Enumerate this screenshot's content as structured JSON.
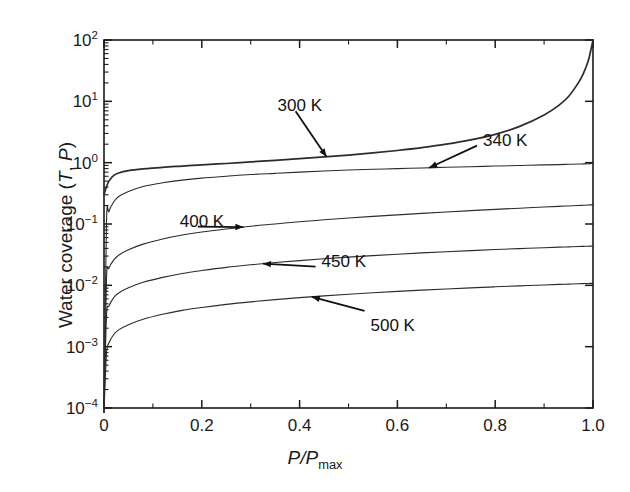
{
  "chart_data": {
    "type": "line",
    "title": "",
    "xlabel": "P/Pmax",
    "ylabel": "Water coverage (T, P)",
    "xlim": [
      0,
      1.0
    ],
    "ylim": [
      0.0001,
      100
    ],
    "yscale": "log",
    "xscale": "linear",
    "grid": false,
    "legend": "inline-annotations",
    "xticks": [
      "0",
      "0.2",
      "0.4",
      "0.6",
      "0.8",
      "1.0"
    ],
    "xtick_values": [
      0,
      0.2,
      0.4,
      0.6,
      0.8,
      1.0
    ],
    "ytick_values": [
      0.0001,
      0.001,
      0.01,
      0.1,
      1,
      10,
      100
    ],
    "yticks": [
      "10-4",
      "10-3",
      "10-2",
      "10-1",
      "100",
      "101",
      "102"
    ],
    "x": [
      0.0,
      0.005,
      0.01,
      0.02,
      0.03,
      0.05,
      0.08,
      0.12,
      0.16,
      0.2,
      0.25,
      0.3,
      0.35,
      0.4,
      0.45,
      0.5,
      0.55,
      0.6,
      0.65,
      0.7,
      0.75,
      0.8,
      0.85,
      0.9,
      0.93,
      0.95,
      0.97,
      0.98,
      0.99,
      0.995,
      1.0
    ],
    "series": [
      {
        "name": "300 K",
        "label": "300 K",
        "values": [
          0.3,
          0.4,
          0.5,
          0.62,
          0.68,
          0.74,
          0.79,
          0.84,
          0.88,
          0.92,
          0.97,
          1.03,
          1.09,
          1.16,
          1.24,
          1.33,
          1.44,
          1.58,
          1.76,
          2.0,
          2.35,
          2.9,
          3.9,
          6.0,
          8.6,
          12.0,
          20.0,
          28.0,
          45.0,
          65.0,
          100.0
        ]
      },
      {
        "name": "340 K",
        "label": "340 K",
        "values": [
          0.0,
          0.1,
          0.16,
          0.23,
          0.28,
          0.34,
          0.41,
          0.47,
          0.52,
          0.56,
          0.6,
          0.64,
          0.67,
          0.7,
          0.73,
          0.76,
          0.78,
          0.8,
          0.82,
          0.84,
          0.86,
          0.88,
          0.9,
          0.92,
          0.93,
          0.94,
          0.95,
          0.955,
          0.96,
          0.965,
          0.97
        ]
      },
      {
        "name": "400 K",
        "label": "400 K",
        "values": [
          0.0,
          0.012,
          0.019,
          0.026,
          0.031,
          0.038,
          0.047,
          0.057,
          0.066,
          0.074,
          0.083,
          0.092,
          0.1,
          0.109,
          0.117,
          0.125,
          0.133,
          0.141,
          0.149,
          0.157,
          0.165,
          0.173,
          0.181,
          0.189,
          0.194,
          0.197,
          0.2,
          0.202,
          0.204,
          0.205,
          0.206
        ]
      },
      {
        "name": "450 K",
        "label": "450 K",
        "values": [
          0.0,
          0.003,
          0.0046,
          0.0063,
          0.0075,
          0.0091,
          0.0112,
          0.0135,
          0.0156,
          0.0174,
          0.0196,
          0.0216,
          0.0235,
          0.0253,
          0.0271,
          0.0288,
          0.0305,
          0.0322,
          0.0338,
          0.0353,
          0.0368,
          0.0383,
          0.0397,
          0.0411,
          0.0419,
          0.0424,
          0.0429,
          0.0432,
          0.0434,
          0.0436,
          0.0437
        ]
      },
      {
        "name": "500 K",
        "label": "500 K",
        "values": [
          0.0,
          0.00075,
          0.00115,
          0.00158,
          0.00188,
          0.00228,
          0.0028,
          0.00338,
          0.0039,
          0.00435,
          0.00489,
          0.00538,
          0.00585,
          0.0063,
          0.00673,
          0.00715,
          0.00756,
          0.00796,
          0.00835,
          0.00873,
          0.0091,
          0.00946,
          0.00981,
          0.01015,
          0.01035,
          0.01048,
          0.01061,
          0.01067,
          0.01073,
          0.01076,
          0.01079
        ]
      }
    ],
    "annotations": [
      {
        "text": "300 K",
        "series": "300 K",
        "x_label": 0.355,
        "y_label": 8.0
      },
      {
        "text": "340 K",
        "series": "340 K",
        "x_label": 0.775,
        "y_label": 2.2
      },
      {
        "text": "400 K",
        "series": "400 K",
        "x_label": 0.155,
        "y_label": 0.105
      },
      {
        "text": "450 K",
        "series": "450 K",
        "x_label": 0.445,
        "y_label": 0.0235
      },
      {
        "text": "500 K",
        "series": "500 K",
        "x_label": 0.545,
        "y_label": 0.0021
      }
    ]
  },
  "axes": {
    "y_title_prefix": "Water coverage (",
    "y_title_T": "T",
    "y_title_mid": ", ",
    "y_title_P": "P",
    "y_title_suffix": ")",
    "x_title_P1": "P",
    "x_title_slash": "/",
    "x_title_P2": "P",
    "x_title_sub": "max"
  }
}
